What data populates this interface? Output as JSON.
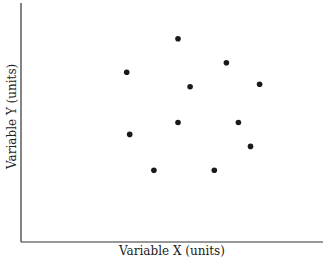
{
  "chart_data": {
    "type": "scatter",
    "title": "",
    "xlabel": "Variable X (units)",
    "ylabel": "Variable Y (units)",
    "xlim": [
      0,
      100
    ],
    "ylim": [
      0,
      100
    ],
    "grid": false,
    "legend": null,
    "tick_labels": false,
    "points": [
      {
        "x": 52,
        "y": 85
      },
      {
        "x": 35,
        "y": 71
      },
      {
        "x": 56,
        "y": 65
      },
      {
        "x": 68,
        "y": 75
      },
      {
        "x": 79,
        "y": 66
      },
      {
        "x": 36,
        "y": 45
      },
      {
        "x": 52,
        "y": 50
      },
      {
        "x": 72,
        "y": 50
      },
      {
        "x": 76,
        "y": 40
      },
      {
        "x": 44,
        "y": 30
      },
      {
        "x": 64,
        "y": 30
      }
    ],
    "marker_color": "#1a1a1a"
  }
}
